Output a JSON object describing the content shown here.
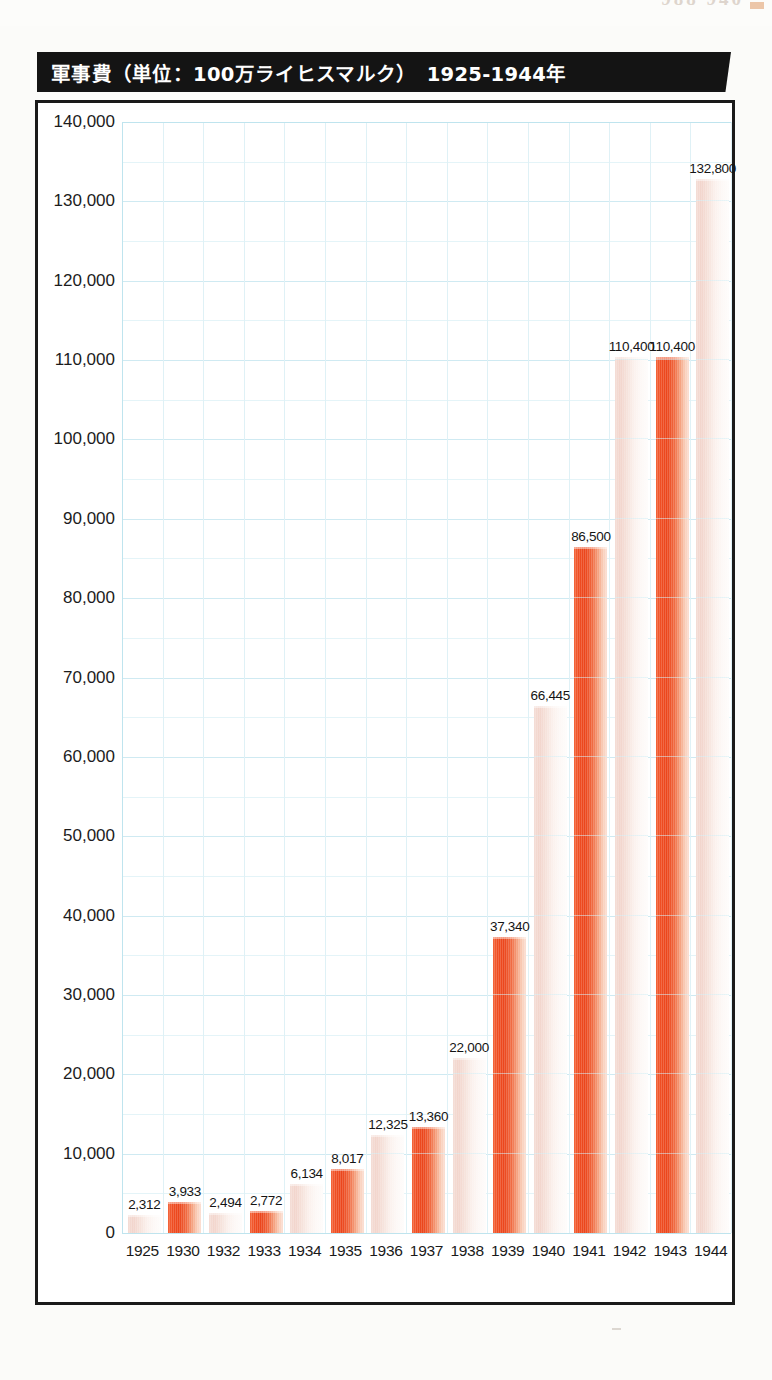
{
  "page": {
    "bleed_text": "988   940",
    "speck": ""
  },
  "figure": {
    "title": "軍事費（単位：100万ライヒスマルク）　1925-1944年",
    "frame_color": "#1a1a1a",
    "banner_color": "#141414",
    "banner_text_color": "#ffffff"
  },
  "chart_data": {
    "type": "bar",
    "title": "軍事費（単位：100万ライヒスマルク）　1925-1944年",
    "subtitle": "",
    "xlabel": "",
    "ylabel": "",
    "unit": "100万ライヒスマルク",
    "period": "1925-1944年",
    "categories": [
      "1925",
      "1930",
      "1932",
      "1933",
      "1934",
      "1935",
      "1936",
      "1937",
      "1938",
      "1939",
      "1940",
      "1941",
      "1942",
      "1943",
      "1944"
    ],
    "values": [
      2312,
      3933,
      2494,
      2772,
      6134,
      8017,
      12325,
      13360,
      22000,
      37340,
      66445,
      86500,
      110400,
      110400,
      132800
    ],
    "data_labels": [
      "2,312",
      "3,933",
      "2,494",
      "2,772",
      "6,134",
      "8,017",
      "12,325",
      "13,360",
      "22,000",
      "37,340",
      "66,445",
      "86,500",
      "110,400",
      "110,400",
      "132,800"
    ],
    "bar_styles": [
      "pale",
      "strong",
      "pale",
      "strong",
      "pale",
      "strong",
      "pale",
      "strong",
      "pale",
      "strong",
      "pale",
      "strong",
      "pale",
      "strong",
      "pale"
    ],
    "ylim": [
      0,
      140000
    ],
    "ytick_step": 10000,
    "yticks": [
      140000,
      130000,
      120000,
      110000,
      100000,
      90000,
      80000,
      70000,
      60000,
      50000,
      40000,
      30000,
      20000,
      10000,
      0
    ],
    "ytick_labels": [
      "140,000",
      "130,000",
      "120,000",
      "110,000",
      "100,000",
      "90,000",
      "80,000",
      "70,000",
      "60,000",
      "50,000",
      "40,000",
      "30,000",
      "20,000",
      "10,000",
      "0"
    ],
    "minor_ytick_step": 5000,
    "grid": true,
    "grid_color": "#cfeaf2",
    "grid_minor_color": "#e4f4f8",
    "grid_vertical": true,
    "legend": false,
    "legend_position": "none",
    "bar_color_strong": "#ef4d22",
    "bar_color_pale": "#f2d4cb",
    "background": "#ffffff"
  }
}
